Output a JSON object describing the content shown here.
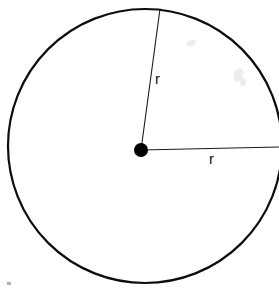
{
  "figure": {
    "background_color": "#ffffff",
    "stroke_color": "#000000",
    "width": 279,
    "height": 292
  },
  "circle": {
    "center_x": 145,
    "center_y": 146,
    "radius": 137,
    "stroke_width": 2.2,
    "fill": "none"
  },
  "center_point": {
    "x": 141,
    "y": 150,
    "radius": 7,
    "fill": "#000000"
  },
  "radii": [
    {
      "id": "diagonal",
      "label": "r",
      "from_x": 141,
      "from_y": 150,
      "to_x": 160,
      "to_y": 9,
      "label_x": 155,
      "label_y": 71,
      "stroke_width": 1
    },
    {
      "id": "horizontal",
      "label": "r",
      "from_x": 141,
      "from_y": 150,
      "to_x": 279,
      "to_y": 147,
      "label_x": 209,
      "label_y": 151,
      "stroke_width": 1
    }
  ],
  "artifacts": {
    "smudge_note": "faint gray scan smudges upper right",
    "speck_note": "small gray speck lower left"
  }
}
